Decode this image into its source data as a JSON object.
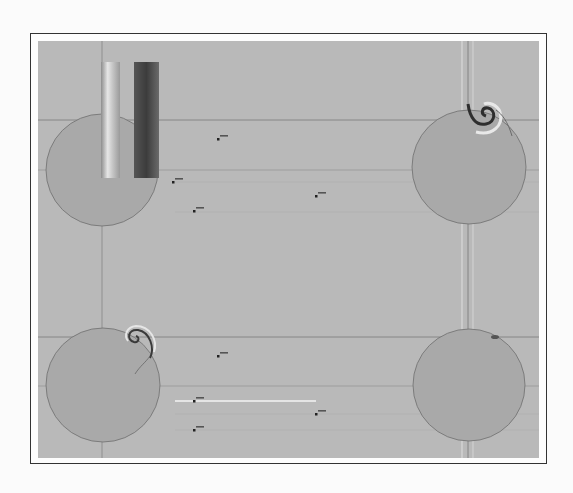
{
  "figure": {
    "colors": {
      "page": "#fbfbfb",
      "frame_border": "#333333",
      "plot_bg": "#b9b9b9",
      "circle_fill": "#a9a9a9",
      "circle_stroke": "#6e6e6e",
      "grid_dark": "#7a7a7a",
      "grid_light": "#dcdcdc"
    },
    "circles": [
      {
        "name": "top-left",
        "cx": 102,
        "cy": 170,
        "r": 56,
        "feature": "none"
      },
      {
        "name": "top-right",
        "cx": 469,
        "cy": 167,
        "r": 57,
        "feature": "spiral vortex at top-right of rim"
      },
      {
        "name": "bottom-left",
        "cx": 103,
        "cy": 385,
        "r": 57,
        "feature": "spiral vortex at top-right of rim"
      },
      {
        "name": "bottom-right",
        "cx": 469,
        "cy": 385,
        "r": 56,
        "feature": "small dark spot on upper rim"
      }
    ],
    "colorbar": {
      "strips": [
        {
          "x": 101,
          "y": 62,
          "w": 19,
          "h": 116,
          "tone": "light"
        },
        {
          "x": 134,
          "y": 62,
          "w": 25,
          "h": 116,
          "tone": "dark"
        }
      ]
    },
    "markers": [
      {
        "x": 173,
        "y": 182,
        "label": ""
      },
      {
        "x": 194,
        "y": 211,
        "label": ""
      },
      {
        "x": 316,
        "y": 196,
        "label": ""
      },
      {
        "x": 218,
        "y": 139,
        "label": ""
      },
      {
        "x": 194,
        "y": 401,
        "label": ""
      },
      {
        "x": 316,
        "y": 414,
        "label": ""
      },
      {
        "x": 194,
        "y": 430,
        "label": ""
      },
      {
        "x": 218,
        "y": 356,
        "label": ""
      }
    ],
    "highlight_line": {
      "x1": 175,
      "x2": 316,
      "y": 401
    }
  }
}
